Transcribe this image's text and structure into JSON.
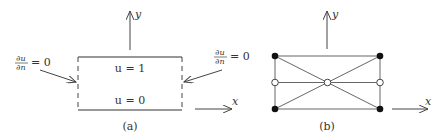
{
  "panel_a": {
    "caption": "(a)",
    "x_axis_label": "x",
    "y_axis_label": "y",
    "top_label": "u = 1",
    "bottom_label": "u = 0",
    "left_bc_num": "∂u",
    "left_bc_den": "∂n",
    "left_bc_rhs": "= 0",
    "right_bc_num": "∂u",
    "right_bc_den": "∂n",
    "right_bc_rhs": "= 0"
  },
  "panel_b": {
    "caption": "(b)",
    "x_axis_label": "x",
    "y_axis_label": "y",
    "filled_nodes": 4,
    "open_nodes": 3
  },
  "colors": {
    "line": "#333333",
    "thin_line": "#666666",
    "node_fill": "#111111"
  }
}
